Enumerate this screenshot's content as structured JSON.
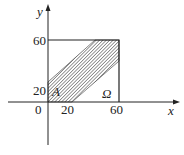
{
  "figure": {
    "axes": {
      "x_label": "x",
      "y_label": "y",
      "origin_label": "0",
      "x_ticks": [
        "20",
        "60"
      ],
      "y_ticks": [
        "20",
        "60"
      ]
    },
    "regions": {
      "square_label": "Ω",
      "shaded_label": "A"
    },
    "colors": {
      "line": "#222222",
      "hatch": "#333333",
      "background": "#ffffff"
    }
  }
}
